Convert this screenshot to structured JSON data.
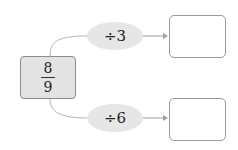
{
  "start": {
    "numerator": "8",
    "denominator": "9"
  },
  "operations": [
    {
      "label": "÷3",
      "result": ""
    },
    {
      "label": "÷6",
      "result": ""
    }
  ],
  "colors": {
    "box_fill": "#e3e3e3",
    "ellipse_fill": "#e6e6e6",
    "line": "#b0b0b0"
  }
}
